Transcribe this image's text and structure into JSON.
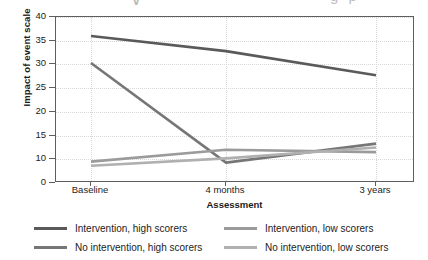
{
  "artifact": {
    "chevron_glyph": "∨",
    "tail_text": "g  p"
  },
  "axes": {
    "y_title": "Impact of event scale",
    "x_title": "Assessment",
    "y_ticks": [
      "40",
      "35",
      "30",
      "25",
      "20",
      "15",
      "10",
      "0"
    ],
    "x_ticks": [
      "Baseline",
      "4 months",
      "3 years"
    ]
  },
  "legend": {
    "items": [
      {
        "label": "Intervention, high scorers",
        "color": "#5a5a5a"
      },
      {
        "label": "Intervention, low scorers",
        "color": "#9b9b9b"
      },
      {
        "label": "No intervention, high scorers",
        "color": "#767676"
      },
      {
        "label": "No intervention, low scorers",
        "color": "#b0b0b0"
      }
    ]
  },
  "chart_data": {
    "type": "line",
    "title": "",
    "xlabel": "Assessment",
    "ylabel": "Impact of event scale",
    "categories": [
      "Baseline",
      "4 months",
      "3 years"
    ],
    "ylim": [
      0,
      40
    ],
    "yticks": [
      0,
      10,
      15,
      20,
      25,
      30,
      35,
      40
    ],
    "grid": true,
    "legend_position": "bottom",
    "series": [
      {
        "name": "Intervention, high scorers",
        "color": "#5a5a5a",
        "values": [
          36.0,
          32.8,
          27.7
        ]
      },
      {
        "name": "No intervention, high scorers",
        "color": "#767676",
        "values": [
          30.3,
          8.6,
          13.3
        ]
      },
      {
        "name": "Intervention, low scorers",
        "color": "#9b9b9b",
        "values": [
          9.0,
          12.0,
          11.5
        ]
      },
      {
        "name": "No intervention, low scorers",
        "color": "#b0b0b0",
        "values": [
          7.3,
          10.2,
          12.5
        ]
      }
    ]
  }
}
